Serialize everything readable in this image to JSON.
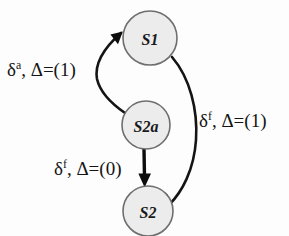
{
  "diagram": {
    "type": "state-transition-graph",
    "background_color": "#fdfdfd",
    "node_fill": "#ececec",
    "node_stroke": "#6e6e6e",
    "edge_color": "#141414",
    "nodes": [
      {
        "id": "S1",
        "label": "S1",
        "cx": 150,
        "cy": 38,
        "r": 27
      },
      {
        "id": "S2a",
        "label": "S2a",
        "cx": 146,
        "cy": 125,
        "r": 24
      },
      {
        "id": "S2",
        "label": "S2",
        "cx": 148,
        "cy": 211,
        "r": 25
      }
    ],
    "edges": [
      {
        "id": "s2a-to-s1",
        "from": "S2a",
        "to": "S1",
        "label_base": "δ",
        "label_sup": "a",
        "label_rest": ", Δ=(1)",
        "label_full": "δa, Δ=(1)"
      },
      {
        "id": "s1-to-s2",
        "from": "S1",
        "to": "S2",
        "label_base": "δ",
        "label_sup": "f",
        "label_rest": ", Δ=(1)",
        "label_full": "δf, Δ=(1)"
      },
      {
        "id": "s2a-to-s2",
        "from": "S2a",
        "to": "S2",
        "label_base": "δ",
        "label_sup": "f",
        "label_rest": ", Δ=(0)",
        "label_full": "δf, Δ=(0)"
      }
    ]
  }
}
